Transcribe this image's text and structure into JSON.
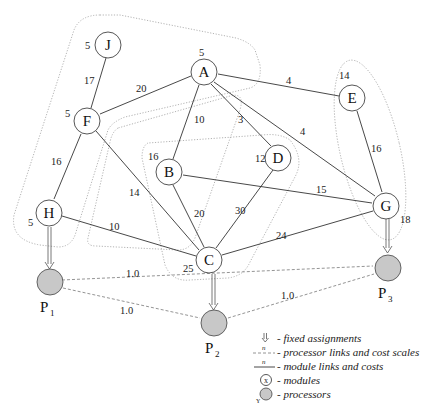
{
  "modules": [
    {
      "id": "J",
      "weight": "5"
    },
    {
      "id": "A",
      "weight": "5"
    },
    {
      "id": "E",
      "weight": "14"
    },
    {
      "id": "F",
      "weight": "5"
    },
    {
      "id": "B",
      "weight": "16"
    },
    {
      "id": "D",
      "weight": "12"
    },
    {
      "id": "H",
      "weight": "5"
    },
    {
      "id": "C",
      "weight": "25"
    },
    {
      "id": "G",
      "weight": "18"
    }
  ],
  "module_links": [
    {
      "from": "J",
      "to": "F",
      "cost": "17"
    },
    {
      "from": "F",
      "to": "A",
      "cost": "20"
    },
    {
      "from": "A",
      "to": "E",
      "cost": "4"
    },
    {
      "from": "A",
      "to": "B",
      "cost": "10"
    },
    {
      "from": "A",
      "to": "D",
      "cost": "3"
    },
    {
      "from": "A",
      "to": "G",
      "cost": "4"
    },
    {
      "from": "E",
      "to": "G",
      "cost": "16"
    },
    {
      "from": "F",
      "to": "H",
      "cost": "16"
    },
    {
      "from": "F",
      "to": "C",
      "cost": "14"
    },
    {
      "from": "B",
      "to": "G",
      "cost": "15"
    },
    {
      "from": "B",
      "to": "C",
      "cost": "20"
    },
    {
      "from": "D",
      "to": "C",
      "cost": "30"
    },
    {
      "from": "H",
      "to": "C",
      "cost": "10"
    },
    {
      "from": "C",
      "to": "G",
      "cost": "24"
    }
  ],
  "processors": [
    {
      "id": "P1",
      "label": "P",
      "sub": "1"
    },
    {
      "id": "P2",
      "label": "P",
      "sub": "2"
    },
    {
      "id": "P3",
      "label": "P",
      "sub": "3"
    }
  ],
  "processor_links": [
    {
      "from": "P1",
      "to": "P3",
      "scale": "1.0"
    },
    {
      "from": "P1",
      "to": "P2",
      "scale": "1.0"
    },
    {
      "from": "P2",
      "to": "P3",
      "scale": "1.0"
    }
  ],
  "fixed_assignments": [
    {
      "module": "H",
      "processor": "P1"
    },
    {
      "module": "C",
      "processor": "P2"
    },
    {
      "module": "G",
      "processor": "P3"
    }
  ],
  "legend": {
    "fixed": "- fixed assignments",
    "plinks": "- processor links and cost scales",
    "mlinks": "- module links and costs",
    "modules": "- modules",
    "processors": "- processors",
    "n_symbol": "n",
    "x_symbol": "x",
    "y_symbol": "Y"
  }
}
